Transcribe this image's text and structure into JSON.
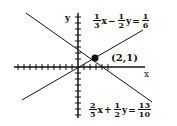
{
  "diagram": {
    "axes": {
      "x_label": "x",
      "y_label": "y",
      "origin_px": [
        78,
        67
      ],
      "tick_spacing_px": 6
    },
    "lines": [
      {
        "name": "line1",
        "equation": "1/3x - 1/2y = 1/6",
        "parts": {
          "a_num": "1",
          "a_den": "3",
          "var1": "x",
          "op": "−",
          "b_num": "1",
          "b_den": "2",
          "var2": "y",
          "eq": "=",
          "c_num": "1",
          "c_den": "6"
        }
      },
      {
        "name": "line2",
        "equation": "2/5x + 1/2y = 13/10",
        "parts": {
          "a_num": "2",
          "a_den": "5",
          "var1": "x",
          "op": "+",
          "b_num": "1",
          "b_den": "2",
          "var2": "y",
          "eq": "=",
          "c_num": "13",
          "c_den": "10"
        }
      }
    ],
    "intersection": {
      "label": "(2,1)",
      "x": 2,
      "y": 1
    },
    "color": "#111111"
  }
}
